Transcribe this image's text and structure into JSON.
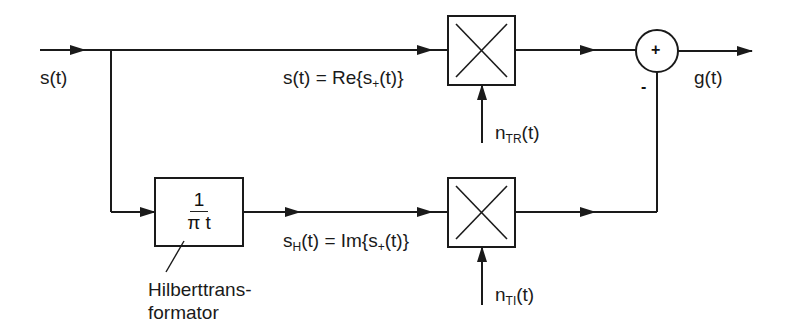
{
  "diagram": {
    "type": "block-diagram",
    "input_label": "s(t)",
    "output_label": "g(t)",
    "top_branch": {
      "equation_prefix": "s(t) = Re{s",
      "equation_sub": "+",
      "equation_suffix": "(t)}",
      "multiplier_symbol": "×",
      "noise_prefix": "n",
      "noise_sub": "TR",
      "noise_suffix": "(t)"
    },
    "bottom_branch": {
      "hilbert_numerator": "1",
      "hilbert_denominator": "π t",
      "hilbert_caption_line1": "Hilberttrans-",
      "hilbert_caption_line2": "formator",
      "equation_prefix": "s",
      "equation_prefix_sub": "H",
      "equation_mid": "(t) = Im{s",
      "equation_sub": "+",
      "equation_suffix": "(t)}",
      "multiplier_symbol": "×",
      "noise_prefix": "n",
      "noise_sub": "TI",
      "noise_suffix": "(t)"
    },
    "summer": {
      "plus_sign": "+",
      "minus_sign": "-"
    },
    "colors": {
      "line": "#1a1a1a",
      "background": "#ffffff"
    }
  }
}
